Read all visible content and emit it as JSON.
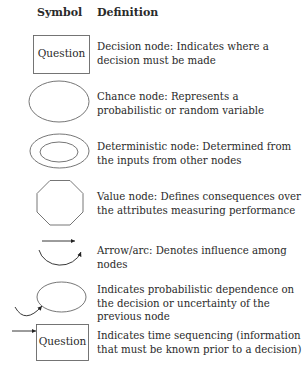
{
  "headers": {
    "symbol": "Symbol",
    "definition": "Definition"
  },
  "rows": [
    {
      "symbol": "rectangle",
      "label": "Question",
      "definition": "Decision node: Indicates where a decision must be made"
    },
    {
      "symbol": "ellipse",
      "definition": "Chance node: Represents a probabilistic or random variable"
    },
    {
      "symbol": "double-ellipse",
      "definition": "Deterministic node: Determined from the inputs from other nodes"
    },
    {
      "symbol": "octagon",
      "definition": "Value node: Defines consequences over the attributes measuring performance"
    },
    {
      "symbol": "arrow-arc",
      "definition": "Arrow/arc:  Denotes influence among nodes"
    },
    {
      "symbol": "ellipse-with-incoming-arc",
      "definition": "Indicates probabilistic dependence on the decision or uncertainty of the previous node"
    },
    {
      "symbol": "rectangle-with-incoming-arrow",
      "label": "Question",
      "definition": "Indicates time sequencing (information that must be known prior to a decision)"
    }
  ]
}
